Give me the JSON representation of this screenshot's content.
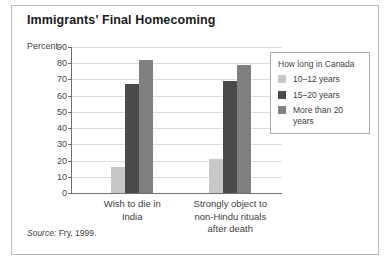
{
  "figure": {
    "title": "Immigrants' Final Homecoming",
    "source_prefix": "Source:",
    "source_text": "Fry, 1999."
  },
  "legend": {
    "title": "How long in Canada",
    "entries": [
      {
        "label": "10–12 years",
        "color": "#c8c8c8"
      },
      {
        "label": "15–20 years",
        "color": "#4a4a4a"
      },
      {
        "label": "More than 20 years",
        "color": "#808080"
      }
    ]
  },
  "chart_data": {
    "type": "bar",
    "title": "Immigrants' Final Homecoming",
    "xlabel": "",
    "ylabel": "Percent",
    "ylim": [
      0,
      90
    ],
    "ytick_step": 10,
    "yticks": [
      0,
      10,
      20,
      30,
      40,
      50,
      60,
      70,
      80,
      90
    ],
    "ytick_labels": [
      "0",
      "10",
      "20",
      "30",
      "40",
      "50",
      "60",
      "70",
      "80",
      "90"
    ],
    "grid": true,
    "legend_position": "right",
    "legend_title": "How long in Canada",
    "categories": [
      "Wish to die in India",
      "Strongly object to non-Hindu rituals after death"
    ],
    "category_label_lines": [
      [
        "Wish to die in",
        "India"
      ],
      [
        "Strongly object to",
        "non-Hindu rituals",
        "after death"
      ]
    ],
    "series": [
      {
        "name": "10–12 years",
        "color": "#c8c8c8",
        "values": [
          16,
          21
        ]
      },
      {
        "name": "15–20 years",
        "color": "#4a4a4a",
        "values": [
          67,
          69
        ]
      },
      {
        "name": "More than 20 years",
        "color": "#808080",
        "values": [
          82,
          79
        ]
      }
    ],
    "source": "Source: Fry, 1999."
  }
}
